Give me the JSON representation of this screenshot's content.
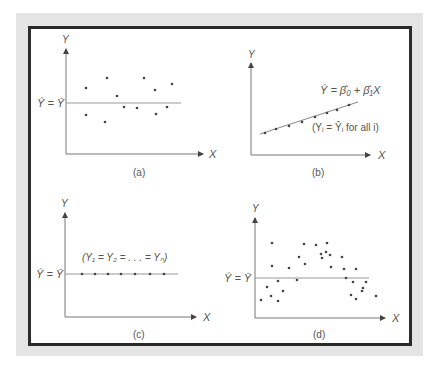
{
  "figure": {
    "panels": [
      {
        "id": "a",
        "caption": "(a)",
        "y_label": "Y",
        "x_label": "X",
        "line_label": "Ŷ = Ȳ"
      },
      {
        "id": "b",
        "caption": "(b)",
        "y_label": "Y",
        "x_label": "X",
        "line_label": "Ŷ = β̂₀ + β̂₁X",
        "note": "(Yᵢ = Ŷᵢ for all i)"
      },
      {
        "id": "c",
        "caption": "(c)",
        "y_label": "Y",
        "x_label": "X",
        "line_label": "Ŷ = Ȳ",
        "note": "(Y₁ = Y₂ = . . . = Yₙ)"
      },
      {
        "id": "d",
        "caption": "(d)",
        "y_label": "Y",
        "x_label": "X",
        "line_label": "Ŷ = Ȳ"
      }
    ]
  },
  "chart_data": [
    {
      "type": "scatter",
      "title": "(a)",
      "xlabel": "X",
      "ylabel": "Y",
      "fit_line": {
        "label": "Ŷ = Ȳ",
        "kind": "horizontal",
        "y": 0
      },
      "description": "Points scattered randomly around horizontal mean line",
      "points_px": [
        [
          86,
          88
        ],
        [
          107,
          78
        ],
        [
          117,
          96
        ],
        [
          124,
          107
        ],
        [
          86,
          115
        ],
        [
          105,
          122
        ],
        [
          137,
          108
        ],
        [
          144,
          78
        ],
        [
          155,
          90
        ],
        [
          156,
          114
        ],
        [
          167,
          107
        ],
        [
          172,
          84
        ]
      ],
      "grid": false
    },
    {
      "type": "scatter",
      "title": "(b)",
      "xlabel": "X",
      "ylabel": "Y",
      "fit_line": {
        "label": "Ŷ = β̂₀ + β̂₁X",
        "kind": "linear",
        "from_px": [
          260,
          134
        ],
        "to_px": [
          358,
          102
        ]
      },
      "annotation": "(Yᵢ = Ŷᵢ for all i)",
      "points_px": [
        [
          265,
          133
        ],
        [
          276,
          129
        ],
        [
          289,
          126
        ],
        [
          302,
          122
        ],
        [
          315,
          117
        ],
        [
          327,
          113
        ],
        [
          337,
          110
        ],
        [
          349,
          105
        ]
      ],
      "grid": false
    },
    {
      "type": "scatter",
      "title": "(c)",
      "xlabel": "X",
      "ylabel": "Y",
      "fit_line": {
        "label": "Ŷ = Ȳ",
        "kind": "horizontal"
      },
      "annotation": "(Y₁ = Y₂ = . . . = Yₙ)",
      "points_px": [
        [
          82,
          274
        ],
        [
          95,
          274
        ],
        [
          108,
          274
        ],
        [
          121,
          274
        ],
        [
          135,
          274
        ],
        [
          150,
          274
        ],
        [
          164,
          274
        ]
      ],
      "grid": false
    },
    {
      "type": "scatter",
      "title": "(d)",
      "xlabel": "X",
      "ylabel": "Y",
      "fit_line": {
        "label": "Ŷ = Ȳ",
        "kind": "horizontal"
      },
      "description": "Points follow an inverted-U (curvilinear) pattern around horizontal mean line",
      "points_px": [
        [
          272,
          243
        ],
        [
          304,
          244
        ],
        [
          316,
          245
        ],
        [
          326,
          252
        ],
        [
          322,
          258
        ],
        [
          299,
          257
        ],
        [
          272,
          266
        ],
        [
          289,
          268
        ],
        [
          305,
          264
        ],
        [
          297,
          280
        ],
        [
          278,
          281
        ],
        [
          267,
          287
        ],
        [
          283,
          291
        ],
        [
          261,
          300
        ],
        [
          271,
          296
        ],
        [
          278,
          301
        ],
        [
          327,
          243
        ],
        [
          321,
          254
        ],
        [
          330,
          255
        ],
        [
          342,
          257
        ],
        [
          331,
          267
        ],
        [
          344,
          269
        ],
        [
          356,
          269
        ],
        [
          346,
          278
        ],
        [
          353,
          282
        ],
        [
          366,
          282
        ],
        [
          351,
          295
        ],
        [
          362,
          291
        ],
        [
          356,
          299
        ],
        [
          376,
          296
        ],
        [
          363,
          288
        ]
      ],
      "grid": false
    }
  ]
}
